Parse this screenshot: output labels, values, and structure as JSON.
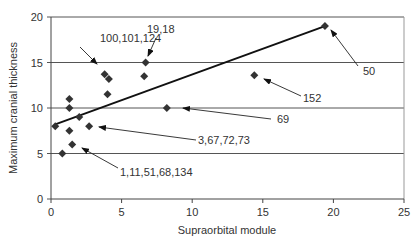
{
  "chart_data": {
    "type": "scatter",
    "title": "",
    "xlabel": "Supraorbital module",
    "ylabel": "Maximum cranial thickness",
    "xlim": [
      0,
      25
    ],
    "ylim": [
      0,
      20
    ],
    "xticks": [
      0,
      5,
      10,
      15,
      20,
      25
    ],
    "yticks": [
      0,
      5,
      10,
      15,
      20
    ],
    "grid": "horizontal",
    "legend": "none",
    "points": [
      {
        "x": 0.3,
        "y": 8.0
      },
      {
        "x": 0.8,
        "y": 5.0
      },
      {
        "x": 1.3,
        "y": 11.0
      },
      {
        "x": 1.3,
        "y": 10.0
      },
      {
        "x": 1.3,
        "y": 7.5
      },
      {
        "x": 1.5,
        "y": 6.0
      },
      {
        "x": 2.0,
        "y": 9.0
      },
      {
        "x": 2.7,
        "y": 8.0
      },
      {
        "x": 3.8,
        "y": 13.7
      },
      {
        "x": 4.1,
        "y": 13.2
      },
      {
        "x": 4.0,
        "y": 11.5
      },
      {
        "x": 6.6,
        "y": 13.5
      },
      {
        "x": 6.7,
        "y": 15.0
      },
      {
        "x": 8.2,
        "y": 10.0
      },
      {
        "x": 14.4,
        "y": 13.6
      },
      {
        "x": 19.4,
        "y": 19.0
      }
    ],
    "trendline": {
      "x1": 0.3,
      "y1": 8.2,
      "x2": 19.4,
      "y2": 19.0
    },
    "annotations": [
      {
        "text": "100,101,124",
        "label_x": 100,
        "label_y": 42,
        "arrow_from": [
          80,
          47
        ],
        "arrow_to": [
          97,
          64
        ]
      },
      {
        "text": "19,18",
        "label_x": 147,
        "label_y": 33,
        "arrow_from": [
          156,
          38
        ],
        "arrow_to": [
          148,
          56
        ]
      },
      {
        "text": "50",
        "label_x": 363,
        "label_y": 75,
        "arrow_from": [
          358,
          66
        ],
        "arrow_to": [
          331,
          30
        ]
      },
      {
        "text": "152",
        "label_x": 303,
        "label_y": 102,
        "arrow_from": [
          301,
          96
        ],
        "arrow_to": [
          264,
          79
        ]
      },
      {
        "text": "69",
        "label_x": 277,
        "label_y": 123,
        "arrow_from": [
          271,
          119
        ],
        "arrow_to": [
          183,
          108
        ]
      },
      {
        "text": "3,67,72,73",
        "label_x": 198,
        "label_y": 144,
        "arrow_from": [
          196,
          140
        ],
        "arrow_to": [
          99,
          127
        ]
      },
      {
        "text": "1,11,51,68,134",
        "label_x": 120,
        "label_y": 176,
        "arrow_from": [
          118,
          168
        ],
        "arrow_to": [
          82,
          148
        ]
      }
    ]
  }
}
